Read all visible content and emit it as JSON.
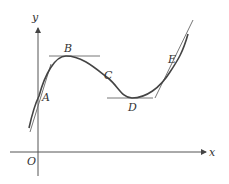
{
  "diagram": {
    "type": "function-graph-with-tangents",
    "axes": {
      "x_label": "x",
      "y_label": "y",
      "origin_label": "O"
    },
    "points": [
      {
        "label": "A",
        "description": "steep tangent near y-axis"
      },
      {
        "label": "B",
        "description": "local maximum, horizontal tangent"
      },
      {
        "label": "C",
        "description": "point on decreasing segment"
      },
      {
        "label": "D",
        "description": "local minimum, horizontal tangent"
      },
      {
        "label": "E",
        "description": "steep tangent on rising segment"
      }
    ],
    "colors": {
      "curve": "#444444",
      "tangent": "#666666",
      "axis": "#555555",
      "label": "#333333"
    }
  }
}
